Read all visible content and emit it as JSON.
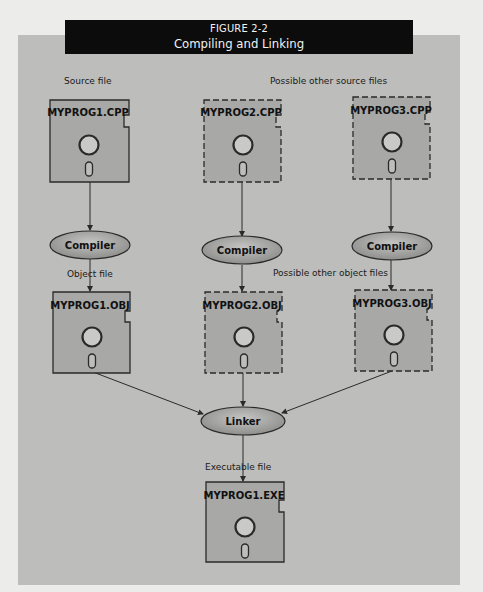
{
  "figure": {
    "number": "FIGURE 2-2",
    "title": "Compiling and Linking"
  },
  "labels": {
    "source_file": "Source file",
    "other_source_files": "Possible other source files",
    "object_file": "Object file",
    "other_object_files": "Possible other object files",
    "executable_file": "Executable file"
  },
  "source_files": [
    {
      "name": "MYPROG1.CPP",
      "style": "solid"
    },
    {
      "name": "MYPROG2.CPP",
      "style": "dashed"
    },
    {
      "name": "MYPROG3.CPP",
      "style": "dashed"
    }
  ],
  "compilers": [
    {
      "label": "Compiler"
    },
    {
      "label": "Compiler"
    },
    {
      "label": "Compiler"
    }
  ],
  "object_files": [
    {
      "name": "MYPROG1.OBJ",
      "style": "solid"
    },
    {
      "name": "MYPROG2.OBJ",
      "style": "dashed"
    },
    {
      "name": "MYPROG3.OBJ",
      "style": "dashed"
    }
  ],
  "linker": {
    "label": "Linker"
  },
  "executable": {
    "name": "MYPROG1.EXE",
    "style": "solid"
  },
  "colors": {
    "page": "#ececea",
    "panel": "#bdbdbb",
    "banner": "#0c0c0c",
    "disk_fill": "#a8a8a6",
    "ellipse_fill": "#a6a6a4",
    "stroke": "#2a2a2a"
  },
  "icons": {
    "disk": "floppy-disk-icon",
    "process": "ellipse-process-node"
  }
}
